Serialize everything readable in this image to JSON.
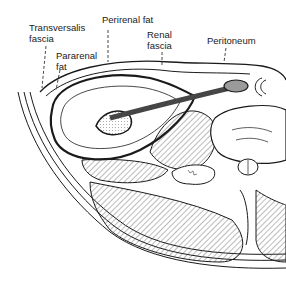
{
  "figure": {
    "labels": {
      "transversalis_fascia": "Transversalis\nfascia",
      "pararenal_fat": "Pararenal\nfat",
      "perirenal_fat": "Perirenal fat",
      "renal_fascia": "Renal\nfascia",
      "peritoneum": "Peritoneum"
    },
    "colors": {
      "line": "#1a1a1a",
      "hatch": "#555555",
      "fill_gray": "#9a9a9a",
      "background": "#ffffff"
    }
  }
}
